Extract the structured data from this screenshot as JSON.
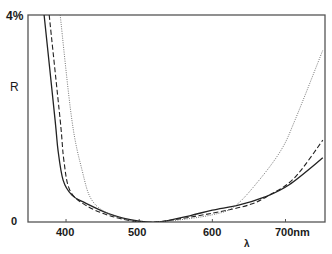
{
  "chart_data": {
    "type": "line",
    "title": "",
    "xlabel": "λ",
    "ylabel": "R",
    "xlim": [
      348,
      754
    ],
    "ylim": [
      0,
      4
    ],
    "x_ticks": [
      400,
      500,
      600,
      700
    ],
    "x_tick_labels": [
      "400",
      "500",
      "600",
      "700nm"
    ],
    "y_tick_labels": [
      "0",
      "4%"
    ],
    "grid": false,
    "legend": null,
    "series": [
      {
        "name": "solid",
        "style": "solid",
        "x": [
          370,
          385,
          389,
          396,
          408,
          426,
          460,
          498,
          528,
          569,
          600,
          637,
          671,
          705,
          751
        ],
        "y": [
          4.0,
          1.97,
          1.39,
          0.81,
          0.52,
          0.37,
          0.15,
          0.02,
          0.0,
          0.12,
          0.23,
          0.33,
          0.48,
          0.72,
          1.24
        ]
      },
      {
        "name": "dashed",
        "style": "dashed",
        "x": [
          377,
          392,
          397,
          405,
          426,
          460,
          501,
          535,
          600,
          650,
          678,
          712,
          751
        ],
        "y": [
          4.0,
          1.97,
          1.2,
          0.62,
          0.33,
          0.12,
          0.0,
          0.02,
          0.17,
          0.33,
          0.52,
          0.85,
          1.58
        ]
      },
      {
        "name": "dotted",
        "style": "dotted",
        "x": [
          392,
          408,
          422,
          435,
          460,
          501,
          541,
          600,
          631,
          664,
          694,
          713,
          751
        ],
        "y": [
          4.0,
          1.97,
          1.0,
          0.43,
          0.15,
          0.0,
          0.02,
          0.14,
          0.31,
          0.81,
          1.39,
          1.97,
          3.32
        ]
      }
    ]
  },
  "labels": {
    "y_top": "4%",
    "y_axis": "R",
    "y_zero": "0",
    "x_axis": "λ",
    "x_ticks": [
      "400",
      "500",
      "600",
      "700nm"
    ]
  }
}
